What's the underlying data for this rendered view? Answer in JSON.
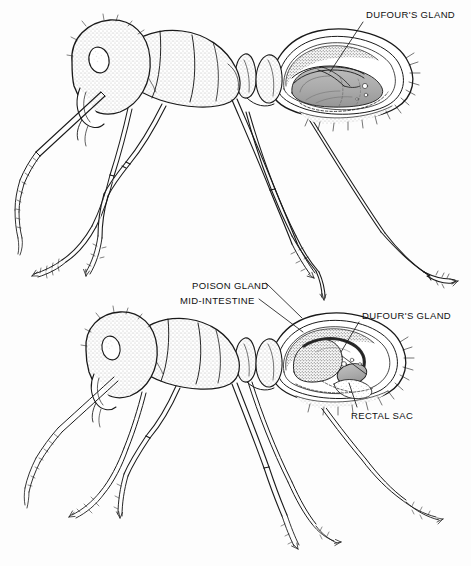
{
  "figure": {
    "background_color": "#fdfdfd",
    "ink_color": "#1a1a1a",
    "shade_color": "#9a9a9a",
    "panels": [
      {
        "name": "upper-ant",
        "description": "Lateral view of worker ant with gaster cut away showing Dufour's gland"
      },
      {
        "name": "lower-ant",
        "description": "Lateral view of worker ant with gaster cut away showing poison gland, mid-intestine, Dufour's gland and rectal sac"
      }
    ]
  },
  "labels": {
    "dufour_top": "DUFOUR'S GLAND",
    "poison_gland": "POISON GLAND",
    "mid_intestine": "MID-INTESTINE",
    "dufour_bottom": "DUFOUR'S GLAND",
    "rectal_sac": "RECTAL SAC"
  },
  "leader_lines": [
    {
      "name": "leader-dufour-top",
      "from": [
        363,
        22
      ],
      "to": [
        330,
        72
      ]
    },
    {
      "name": "leader-poison",
      "from": [
        266,
        283
      ],
      "to": [
        300,
        318
      ]
    },
    {
      "name": "leader-mid-intestine",
      "from": [
        259,
        299
      ],
      "to": [
        300,
        330
      ]
    },
    {
      "name": "leader-dufour-bottom",
      "from": [
        360,
        322
      ],
      "to": [
        341,
        351
      ]
    },
    {
      "name": "leader-rectal-sac",
      "from": [
        357,
        407
      ],
      "to": [
        348,
        383
      ]
    }
  ]
}
